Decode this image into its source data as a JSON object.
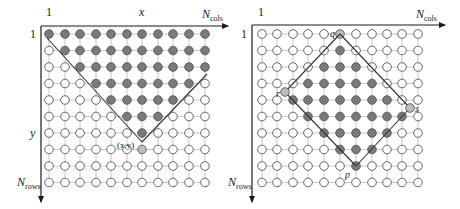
{
  "colors": {
    "background": "#ffffff",
    "axis": "#1a1a1a",
    "grid": "#c8c8c8",
    "node_empty_fill": "#ffffff",
    "node_stroke": "#555555",
    "node_filled": "#7a7a7a",
    "node_highlight": "#bdbdbd",
    "boundary_line": "#333333"
  },
  "grid": {
    "rows": 10,
    "cols": 11
  },
  "panels": [
    {
      "id": "left",
      "origin": {
        "x": 41,
        "y": 26
      },
      "axis_end": {
        "x": 228,
        "y": 202
      },
      "col_x": [
        49,
        65,
        80,
        96,
        111,
        127,
        142,
        158,
        173,
        189,
        205
      ],
      "row_y": [
        34,
        50.5,
        67,
        83.5,
        100,
        116.5,
        133,
        149.5,
        166,
        182.5
      ],
      "labels": {
        "top_start": "1",
        "top_mid": "x",
        "top_end_main": "N",
        "top_end_sub": "cols",
        "left_start": "1",
        "left_mid": "y",
        "left_end_main": "N",
        "left_end_sub": "rows",
        "point_label": "(x,y)"
      },
      "filled": [
        [
          1,
          1,
          1,
          1,
          1,
          1,
          1,
          1,
          1,
          1,
          1
        ],
        [
          0,
          1,
          1,
          1,
          1,
          1,
          1,
          1,
          1,
          1,
          1
        ],
        [
          0,
          0,
          1,
          1,
          1,
          1,
          1,
          1,
          1,
          1,
          1
        ],
        [
          0,
          0,
          0,
          1,
          1,
          1,
          1,
          1,
          1,
          1,
          0
        ],
        [
          0,
          0,
          0,
          0,
          1,
          1,
          1,
          1,
          1,
          0,
          0
        ],
        [
          0,
          0,
          0,
          0,
          0,
          1,
          1,
          1,
          0,
          0,
          0
        ],
        [
          0,
          0,
          0,
          0,
          0,
          0,
          1,
          0,
          0,
          0,
          0
        ],
        [
          0,
          0,
          0,
          0,
          0,
          0,
          2,
          0,
          0,
          0,
          0
        ],
        [
          0,
          0,
          0,
          0,
          0,
          0,
          0,
          0,
          0,
          0,
          0
        ],
        [
          0,
          0,
          0,
          0,
          0,
          0,
          0,
          0,
          0,
          0,
          0
        ]
      ],
      "lines": [
        [
          [
            47,
            38
          ],
          [
            142,
            142
          ]
        ],
        [
          [
            142,
            142
          ],
          [
            207,
            74
          ]
        ]
      ]
    },
    {
      "id": "right",
      "origin": {
        "x": 252,
        "y": 25
      },
      "axis_end": {
        "x": 445,
        "y": 202
      },
      "col_x": [
        262,
        277,
        293,
        308,
        324,
        340,
        356,
        372,
        387,
        402,
        418
      ],
      "row_y": [
        34,
        50.5,
        67,
        83.5,
        100,
        116.5,
        133,
        149.5,
        166,
        182.5
      ],
      "labels": {
        "top_start": "1",
        "top_end_main": "N",
        "top_end_sub": "cols",
        "left_start": "1",
        "left_end_main": "N",
        "left_end_sub": "rows",
        "q": "q",
        "r": "r",
        "s": "s",
        "p": "p"
      },
      "filled": [
        [
          0,
          0,
          0,
          0,
          0,
          2,
          0,
          0,
          0,
          0,
          0
        ],
        [
          0,
          0,
          0,
          0,
          0,
          1,
          0,
          0,
          0,
          0,
          0
        ],
        [
          0,
          0,
          0,
          0,
          1,
          1,
          1,
          0,
          0,
          0,
          0
        ],
        [
          0,
          0,
          0,
          1,
          1,
          1,
          1,
          1,
          0,
          0,
          0
        ],
        [
          0,
          0,
          1,
          1,
          1,
          1,
          1,
          1,
          1,
          0,
          0
        ],
        [
          0,
          0,
          0,
          1,
          1,
          1,
          1,
          1,
          1,
          1,
          0
        ],
        [
          0,
          0,
          0,
          0,
          1,
          1,
          1,
          1,
          1,
          0,
          0
        ],
        [
          0,
          0,
          0,
          0,
          0,
          1,
          1,
          1,
          0,
          0,
          0
        ],
        [
          0,
          0,
          0,
          0,
          0,
          0,
          1,
          0,
          0,
          0,
          0
        ],
        [
          0,
          0,
          0,
          0,
          0,
          0,
          0,
          0,
          0,
          0,
          0
        ]
      ],
      "extra_points": [
        {
          "name": "r",
          "x": 285,
          "y": 92
        },
        {
          "name": "s",
          "x": 410,
          "y": 108
        }
      ],
      "lines": [
        [
          [
            340,
            34
          ],
          [
            285,
            92
          ]
        ],
        [
          [
            285,
            92
          ],
          [
            356,
            166
          ]
        ],
        [
          [
            340,
            34
          ],
          [
            410,
            108
          ]
        ],
        [
          [
            410,
            108
          ],
          [
            356,
            166
          ]
        ]
      ]
    }
  ]
}
